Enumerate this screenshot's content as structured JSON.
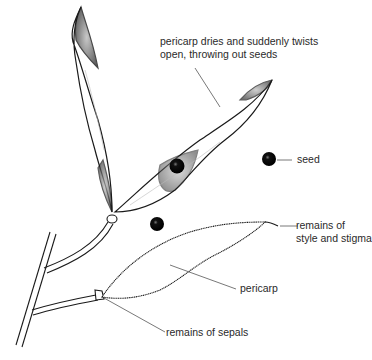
{
  "diagram": {
    "labels": {
      "pericarp_twists_line1": "pericarp dries and suddenly twists",
      "pericarp_twists_line2": "open, throwing out seeds",
      "seed": "seed",
      "style_stigma_line1": "remains of",
      "style_stigma_line2": "style and stigma",
      "pericarp": "pericarp",
      "sepals": "remains of sepals"
    },
    "colors": {
      "ink": "#1a1a1a",
      "leader": "#555555",
      "background": "#ffffff"
    }
  }
}
